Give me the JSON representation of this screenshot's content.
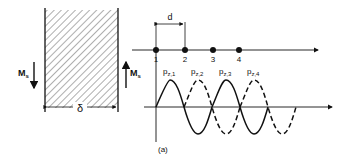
{
  "figure": {
    "caption": "(a)",
    "slab": {
      "thickness_label": "δ",
      "left_moment_label": "M",
      "left_moment_sub": "s",
      "right_moment_label": "M",
      "right_moment_sub": "s"
    },
    "lattice": {
      "spacing_label": "d",
      "points": [
        "1",
        "2",
        "3",
        "4"
      ]
    },
    "orbitals": [
      {
        "label": "p",
        "sub": "z,1",
        "style": "solid"
      },
      {
        "label": "p",
        "sub": "z,2",
        "style": "dashed"
      },
      {
        "label": "p",
        "sub": "z,3",
        "style": "solid"
      },
      {
        "label": "p",
        "sub": "z,4",
        "style": "dashed"
      }
    ]
  }
}
